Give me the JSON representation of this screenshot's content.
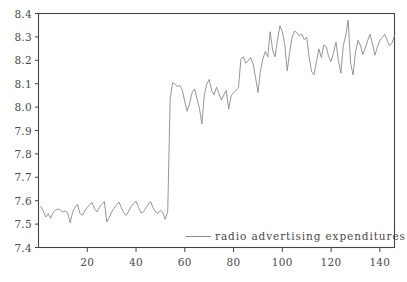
{
  "chart_data": {
    "type": "line",
    "title": "",
    "xlabel": "",
    "ylabel": "",
    "xlim": [
      0,
      146
    ],
    "ylim": [
      7.4,
      8.4
    ],
    "grid": false,
    "legend_position": "bottom-center-inside",
    "x_ticks": [
      20,
      40,
      60,
      80,
      100,
      120,
      140
    ],
    "x_tick_labels": [
      "20",
      "40",
      "60",
      "80",
      "100",
      "120",
      "140"
    ],
    "y_ticks": [
      7.4,
      7.5,
      7.6,
      7.7,
      7.8,
      7.9,
      8.0,
      8.1,
      8.2,
      8.3,
      8.4
    ],
    "y_tick_labels": [
      "7.4",
      "7.5",
      "7.6",
      "7.7",
      "7.8",
      "7.9",
      "8.0",
      "8.1",
      "8.2",
      "8.3",
      "8.4"
    ],
    "line_color": "#8a8a8a",
    "frame_color": "#444444",
    "series": [
      {
        "name": "radio advertising expenditures",
        "x": [
          1,
          2,
          3,
          4,
          5,
          6,
          7,
          8,
          9,
          10,
          11,
          12,
          13,
          14,
          15,
          16,
          17,
          18,
          19,
          20,
          21,
          22,
          23,
          24,
          25,
          26,
          27,
          28,
          29,
          30,
          31,
          32,
          33,
          34,
          35,
          36,
          37,
          38,
          39,
          40,
          41,
          42,
          43,
          44,
          45,
          46,
          47,
          48,
          49,
          50,
          51,
          52,
          53,
          54,
          55,
          56,
          57,
          58,
          59,
          60,
          61,
          62,
          63,
          64,
          65,
          66,
          67,
          68,
          69,
          70,
          71,
          72,
          73,
          74,
          75,
          76,
          77,
          78,
          79,
          80,
          81,
          82,
          83,
          84,
          85,
          86,
          87,
          88,
          89,
          90,
          91,
          92,
          93,
          94,
          95,
          96,
          97,
          98,
          99,
          100,
          101,
          102,
          103,
          104,
          105,
          106,
          107,
          108,
          109,
          110,
          111,
          112,
          113,
          114,
          115,
          116,
          117,
          118,
          119,
          120,
          121,
          122,
          123,
          124,
          125,
          126,
          127,
          128,
          129,
          130,
          131,
          132,
          133,
          134,
          135,
          136,
          137,
          138,
          139,
          140,
          141,
          142,
          143,
          144,
          145,
          146
        ],
        "values": [
          7.575,
          7.555,
          7.53,
          7.545,
          7.525,
          7.55,
          7.56,
          7.565,
          7.56,
          7.552,
          7.556,
          7.548,
          7.505,
          7.552,
          7.572,
          7.585,
          7.545,
          7.538,
          7.556,
          7.572,
          7.584,
          7.592,
          7.565,
          7.552,
          7.572,
          7.585,
          7.596,
          7.51,
          7.528,
          7.552,
          7.568,
          7.582,
          7.594,
          7.57,
          7.548,
          7.538,
          7.556,
          7.575,
          7.588,
          7.598,
          7.572,
          7.548,
          7.552,
          7.568,
          7.584,
          7.596,
          7.57,
          7.552,
          7.545,
          7.56,
          7.548,
          7.52,
          7.555,
          8.035,
          8.105,
          8.098,
          8.088,
          8.092,
          8.072,
          8.022,
          7.982,
          8.018,
          8.062,
          8.078,
          8.035,
          7.995,
          7.928,
          8.052,
          8.098,
          8.118,
          8.072,
          8.052,
          8.085,
          8.058,
          8.03,
          8.052,
          8.072,
          7.992,
          8.048,
          8.062,
          8.072,
          8.082,
          8.205,
          8.215,
          8.188,
          8.198,
          8.212,
          8.185,
          8.128,
          8.062,
          8.152,
          8.205,
          8.238,
          8.215,
          8.322,
          8.245,
          8.215,
          8.285,
          8.348,
          8.322,
          8.268,
          8.155,
          8.235,
          8.298,
          8.325,
          8.318,
          8.305,
          8.312,
          8.288,
          8.298,
          8.212,
          8.152,
          8.138,
          8.195,
          8.248,
          8.212,
          8.265,
          8.258,
          8.215,
          8.195,
          8.232,
          8.278,
          8.198,
          8.145,
          8.262,
          8.305,
          8.372,
          8.188,
          8.138,
          8.235,
          8.285,
          8.265,
          8.225,
          8.252,
          8.285,
          8.312,
          8.268,
          8.222,
          8.258,
          8.285,
          8.298,
          8.312,
          8.285,
          8.262,
          8.275,
          8.305
        ]
      }
    ]
  },
  "legend": {
    "label": "radio advertising expenditures",
    "swatch": "line-swatch"
  }
}
